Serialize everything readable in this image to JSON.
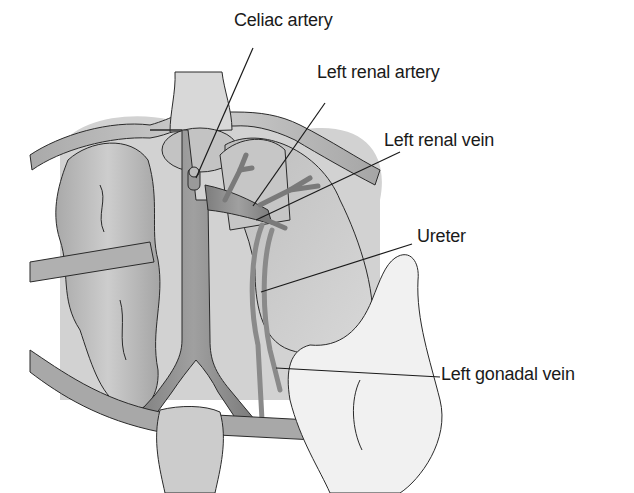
{
  "diagram": {
    "labels": [
      {
        "id": "celiac",
        "text": "Celiac artery",
        "x": 234,
        "y": 10,
        "pointer": [
          [
            253,
            48
          ],
          [
            196,
            178
          ]
        ]
      },
      {
        "id": "left_renal_artery",
        "text": "Left renal artery",
        "x": 317,
        "y": 62,
        "pointer": [
          [
            325,
            103
          ],
          [
            253,
            206
          ]
        ]
      },
      {
        "id": "left_renal_vein",
        "text": "Left renal vein",
        "x": 384,
        "y": 130,
        "pointer": [
          [
            400,
            152
          ],
          [
            256,
            220
          ]
        ]
      },
      {
        "id": "ureter",
        "text": "Ureter",
        "x": 417,
        "y": 226,
        "pointer": [
          [
            412,
            244
          ],
          [
            261,
            292
          ]
        ]
      },
      {
        "id": "left_gonadal_vein",
        "text": "Left gonadal vein",
        "x": 441,
        "y": 364,
        "pointer": [
          [
            440,
            377
          ],
          [
            276,
            368
          ]
        ]
      }
    ],
    "colors": {
      "background": "#ffffff",
      "organ_light": "#cfcfcf",
      "organ_mid": "#b3b3b3",
      "vessel_dark": "#8c8c8c",
      "hand": "#f2f2f2",
      "outline": "#2a2a2a",
      "pointer_line": "#1a1a1a"
    }
  }
}
